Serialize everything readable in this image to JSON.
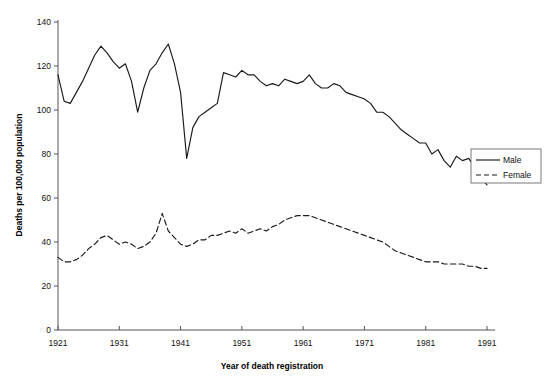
{
  "chart_data": {
    "type": "line",
    "title": "",
    "xlabel": "Year of death registration",
    "ylabel": "Deaths per 100,000 population",
    "xlim": [
      1921,
      1991
    ],
    "ylim": [
      0,
      140
    ],
    "yticks": [
      0,
      20,
      40,
      60,
      80,
      100,
      120,
      140
    ],
    "xticks": [
      1921,
      1931,
      1941,
      1951,
      1961,
      1971,
      1981,
      1991
    ],
    "grid": false,
    "legend_position": "right",
    "x": [
      1921,
      1922,
      1923,
      1924,
      1925,
      1926,
      1927,
      1928,
      1929,
      1930,
      1931,
      1932,
      1933,
      1934,
      1935,
      1936,
      1937,
      1938,
      1939,
      1940,
      1941,
      1942,
      1943,
      1944,
      1945,
      1946,
      1947,
      1948,
      1949,
      1950,
      1951,
      1952,
      1953,
      1954,
      1955,
      1956,
      1957,
      1958,
      1959,
      1960,
      1961,
      1962,
      1963,
      1964,
      1965,
      1966,
      1967,
      1968,
      1969,
      1970,
      1971,
      1972,
      1973,
      1974,
      1975,
      1976,
      1977,
      1978,
      1979,
      1980,
      1981,
      1982,
      1983,
      1984,
      1985,
      1986,
      1987,
      1988,
      1989,
      1990,
      1991
    ],
    "series": [
      {
        "name": "Male",
        "linestyle": "solid",
        "values": [
          116,
          104,
          103,
          108,
          113,
          119,
          125,
          129,
          126,
          122,
          119,
          121,
          113,
          99,
          110,
          118,
          121,
          126,
          130,
          121,
          108,
          78,
          92,
          97,
          99,
          101,
          103,
          117,
          116,
          115,
          118,
          116,
          116,
          113,
          111,
          112,
          111,
          114,
          113,
          112,
          113,
          116,
          112,
          110,
          110,
          112,
          111,
          108,
          107,
          106,
          105,
          103,
          99,
          99,
          97,
          94,
          91,
          89,
          87,
          85,
          85,
          80,
          82,
          77,
          74,
          79,
          77,
          78,
          74,
          69,
          66
        ]
      },
      {
        "name": "Female",
        "linestyle": "dashed",
        "values": [
          33,
          31,
          31,
          32,
          34,
          37,
          39,
          42,
          43,
          41,
          39,
          40,
          39,
          37,
          38,
          40,
          44,
          53,
          45,
          42,
          39,
          38,
          39,
          41,
          41,
          43,
          43,
          44,
          45,
          44,
          46,
          44,
          45,
          46,
          45,
          47,
          48,
          50,
          51,
          52,
          52,
          52,
          51,
          50,
          49,
          48,
          47,
          46,
          45,
          44,
          43,
          42,
          41,
          40,
          38,
          36,
          35,
          34,
          33,
          32,
          31,
          31,
          31,
          30,
          30,
          30,
          30,
          29,
          29,
          28,
          28
        ]
      }
    ]
  },
  "legend": {
    "items": [
      {
        "label": "Male",
        "style": "solid"
      },
      {
        "label": "Female",
        "style": "dashed"
      }
    ]
  },
  "cropped_header_text": ""
}
